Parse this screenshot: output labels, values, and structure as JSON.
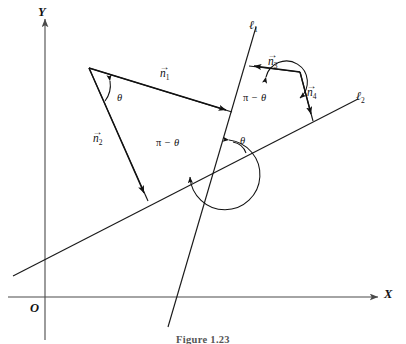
{
  "figure": {
    "caption": "Figure 1.23",
    "background_color": "#ffffff",
    "stroke_color": "#111111",
    "axis_color": "#4a4a4a"
  },
  "axes": {
    "x_label": "X",
    "y_label": "Y",
    "origin_label": "O"
  },
  "lines": [
    {
      "id": "l1",
      "label": "ℓ",
      "subscript": "1"
    },
    {
      "id": "l2",
      "label": "ℓ",
      "subscript": "2"
    }
  ],
  "vectors": [
    {
      "id": "n1",
      "symbol": "n",
      "subscript": "1",
      "harpoon": "→"
    },
    {
      "id": "n2",
      "symbol": "n",
      "subscript": "2",
      "harpoon": "→"
    },
    {
      "id": "n3",
      "symbol": "n",
      "subscript": "3",
      "harpoon": "→"
    },
    {
      "id": "n4",
      "symbol": "n",
      "subscript": "4",
      "harpoon": "→"
    }
  ],
  "angles": [
    {
      "id": "theta-top-left",
      "text": "θ"
    },
    {
      "id": "theta-intersection",
      "text": "θ"
    },
    {
      "id": "pi-minus-theta-left",
      "pi": "π",
      "minus": "−",
      "theta": "θ"
    },
    {
      "id": "pi-minus-theta-right",
      "pi": "π",
      "minus": "−",
      "theta": "θ"
    }
  ]
}
